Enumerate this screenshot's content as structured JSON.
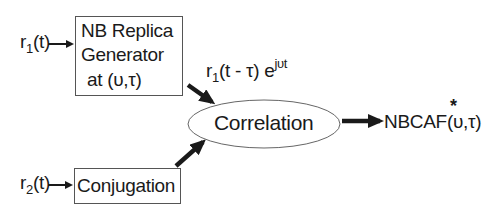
{
  "diagram": {
    "inputs": {
      "r1": {
        "base": "r",
        "subscript": "1",
        "suffix": "(t)"
      },
      "r2": {
        "base": "r",
        "subscript": "2",
        "suffix": "(t)"
      }
    },
    "blocks": {
      "replica_generator": {
        "line1": "NB Replica",
        "line2": "Generator",
        "line3": "at (υ,τ)"
      },
      "conjugation": {
        "label": "Conjugation"
      },
      "correlation": {
        "label": "Correlation"
      }
    },
    "signal_label": {
      "base": "r",
      "subscript": "1",
      "middle": "(t - τ) e",
      "exponent": "jυt"
    },
    "output": {
      "prefix": "NBCAF",
      "star": "*",
      "args": "(υ,τ)"
    },
    "colors": {
      "stroke": "#1a1a1a",
      "box_border": "#555555",
      "ellipse_border": "#666666",
      "background": "#ffffff"
    }
  }
}
